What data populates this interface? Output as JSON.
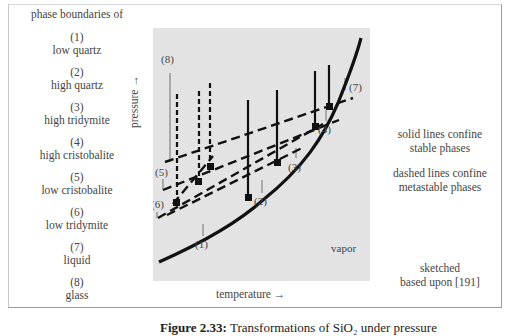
{
  "legend_left": {
    "header": "phase boundaries of",
    "items": [
      {
        "num": "(1)",
        "name": "low quartz"
      },
      {
        "num": "(2)",
        "name": "high quartz"
      },
      {
        "num": "(3)",
        "name": "high tridymite"
      },
      {
        "num": "(4)",
        "name": "high cristobalite"
      },
      {
        "num": "(5)",
        "name": "low cristobalite"
      },
      {
        "num": "(6)",
        "name": "low tridymite"
      },
      {
        "num": "(7)",
        "name": "liquid"
      },
      {
        "num": "(8)",
        "name": "glass"
      }
    ]
  },
  "axes": {
    "y_label": "pressure →",
    "x_label": "temperature →"
  },
  "plot": {
    "region_label": "vapor",
    "curve_labels": [
      "(1)",
      "(2)",
      "(3)",
      "(4)",
      "(5)",
      "(6)",
      "(7)",
      "(8)"
    ]
  },
  "notes_right": {
    "solid_line1": "solid lines confine",
    "solid_line2": "stable phases",
    "dashed_line1": "dashed lines confine",
    "dashed_line2": "metastable phases",
    "source_line1": "sketched",
    "source_line2": "based upon [191]"
  },
  "caption": {
    "prefix": "Figure 2.33:",
    "text": "Transformations of SiO₂ under pressure"
  }
}
